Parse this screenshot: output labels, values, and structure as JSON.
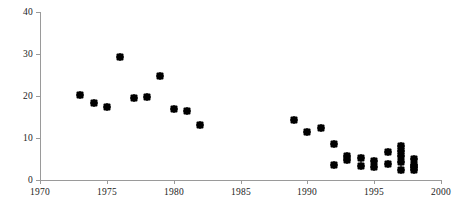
{
  "chart_data": {
    "type": "scatter",
    "title": "",
    "subtitle": "",
    "xlabel": "",
    "ylabel": "",
    "xlim": [
      1970,
      2000
    ],
    "ylim": [
      0,
      40
    ],
    "xticks": [
      1970,
      1975,
      1980,
      1985,
      1990,
      1995,
      2000
    ],
    "yticks": [
      0,
      10,
      20,
      30,
      40
    ],
    "xtick_labels": [
      "1970",
      "1975",
      "1980",
      "1985",
      "1990",
      "1995",
      "2000"
    ],
    "ytick_labels": [
      "0",
      "10",
      "20",
      "30",
      "40"
    ],
    "grid": false,
    "legend": null,
    "marker": "diamond",
    "marker_color": "#000000",
    "axis_color": "#9a9a9a",
    "series": [
      {
        "name": "observations",
        "points": [
          {
            "x": 1973,
            "y": 20.2
          },
          {
            "x": 1974,
            "y": 18.3
          },
          {
            "x": 1975,
            "y": 17.4
          },
          {
            "x": 1976,
            "y": 29.3
          },
          {
            "x": 1977,
            "y": 19.6
          },
          {
            "x": 1978,
            "y": 19.8
          },
          {
            "x": 1979,
            "y": 24.8
          },
          {
            "x": 1980,
            "y": 17.0
          },
          {
            "x": 1981,
            "y": 16.5
          },
          {
            "x": 1982,
            "y": 13.0
          },
          {
            "x": 1989,
            "y": 14.2
          },
          {
            "x": 1990,
            "y": 11.5
          },
          {
            "x": 1991,
            "y": 12.4
          },
          {
            "x": 1992,
            "y": 8.7
          },
          {
            "x": 1992,
            "y": 3.7
          },
          {
            "x": 1993,
            "y": 5.8
          },
          {
            "x": 1993,
            "y": 4.8
          },
          {
            "x": 1994,
            "y": 5.2
          },
          {
            "x": 1994,
            "y": 3.4
          },
          {
            "x": 1995,
            "y": 4.5
          },
          {
            "x": 1995,
            "y": 3.2
          },
          {
            "x": 1996,
            "y": 6.7
          },
          {
            "x": 1996,
            "y": 3.8
          },
          {
            "x": 1997,
            "y": 8.2
          },
          {
            "x": 1997,
            "y": 6.8
          },
          {
            "x": 1997,
            "y": 5.8
          },
          {
            "x": 1997,
            "y": 4.3
          },
          {
            "x": 1997,
            "y": 2.3
          },
          {
            "x": 1998,
            "y": 5.1
          },
          {
            "x": 1998,
            "y": 3.5
          },
          {
            "x": 1998,
            "y": 3.0
          },
          {
            "x": 1998,
            "y": 2.4
          }
        ]
      }
    ]
  }
}
